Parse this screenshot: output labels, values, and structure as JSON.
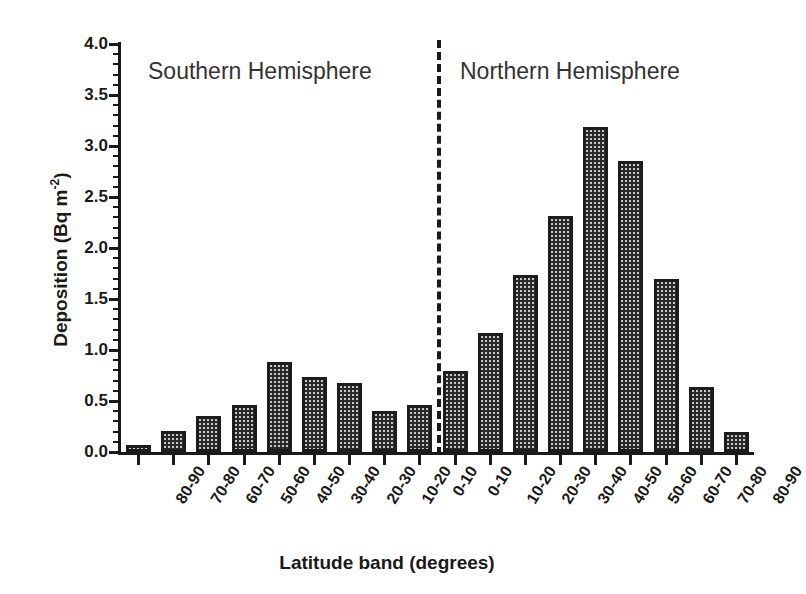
{
  "chart_data": {
    "type": "bar",
    "title": "",
    "xlabel": "Latitude band (degrees)",
    "ylabel": "Deposition (Bq m",
    "ylabel_exponent": "-2",
    "ylabel_suffix": ")",
    "ylim": [
      0.0,
      4.0
    ],
    "ytick_step": 0.5,
    "yminor_step": 0.1,
    "grid": false,
    "legend": "none",
    "ytick_labels": [
      "0.0",
      "0.5",
      "1.0",
      "1.5",
      "2.0",
      "2.5",
      "3.0",
      "3.5",
      "4.0"
    ],
    "ytick_values": [
      0.0,
      0.5,
      1.0,
      1.5,
      2.0,
      2.5,
      3.0,
      3.5,
      4.0
    ],
    "categories": [
      "80-90",
      "70-80",
      "60-70",
      "50-60",
      "40-50",
      "30-40",
      "20-30",
      "10-20",
      "0-10",
      "0-10",
      "10-20",
      "20-30",
      "30-40",
      "40-50",
      "50-60",
      "60-70",
      "70-80",
      "80-90"
    ],
    "values": [
      0.07,
      0.21,
      0.35,
      0.46,
      0.88,
      0.74,
      0.68,
      0.4,
      0.46,
      0.79,
      1.17,
      1.74,
      2.31,
      3.19,
      2.85,
      1.7,
      0.64,
      0.2
    ],
    "annotations": [
      {
        "text": "Southern Hemisphere",
        "region": "left"
      },
      {
        "text": "Northern Hemisphere",
        "region": "right"
      }
    ],
    "divider": {
      "style": "dashed",
      "orientation": "vertical",
      "between_index": 9
    },
    "bar_style": {
      "fill": "#c8c8c8",
      "pattern": "checkerboard",
      "edge_color": "#1c1c1c"
    }
  },
  "figure": {
    "background": "#ffffff",
    "axis_color": "#1a1a1a"
  }
}
